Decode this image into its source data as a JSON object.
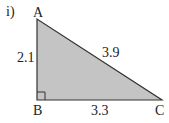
{
  "problem": {
    "part_label": "i)"
  },
  "triangle": {
    "fill_color": "#c4c4c4",
    "stroke_color": "#333333",
    "vertices": {
      "A": "A",
      "B": "B",
      "C": "C"
    },
    "sides": {
      "AB": "2.1",
      "AC": "3.9",
      "BC": "3.3"
    },
    "right_angle_at": "B"
  }
}
